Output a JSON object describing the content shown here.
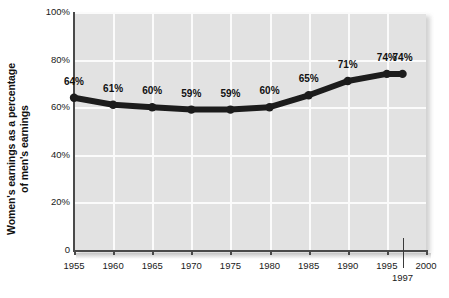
{
  "chart_data": {
    "type": "line",
    "title": "",
    "xlabel": "",
    "ylabel": "Women's earnings as a percentage of men's earnings",
    "ylabel_lines": [
      "Women's earnings as a percentage",
      "of men's earnings"
    ],
    "categories": [
      1955,
      1960,
      1965,
      1970,
      1975,
      1980,
      1985,
      1990,
      1995,
      1997
    ],
    "values": [
      64,
      61,
      60,
      59,
      59,
      60,
      65,
      71,
      74,
      74
    ],
    "point_labels": [
      "64%",
      "61%",
      "60%",
      "59%",
      "59%",
      "60%",
      "65%",
      "71%",
      "74%",
      "74%"
    ],
    "ylim": [
      0,
      100
    ],
    "xlim": [
      1955,
      2000
    ],
    "y_ticks": [
      0,
      20,
      40,
      60,
      80,
      100
    ],
    "y_tick_labels": [
      "0",
      "20%",
      "40%",
      "60%",
      "80%",
      "100%"
    ],
    "x_ticks": [
      1955,
      1960,
      1965,
      1970,
      1975,
      1980,
      1985,
      1990,
      1995,
      2000
    ],
    "x_tick_labels": [
      "1955",
      "1960",
      "1965",
      "1970",
      "1975",
      "1980",
      "1985",
      "1990",
      "1995",
      "2000"
    ],
    "x_extra_tick": 1997,
    "x_extra_tick_label": "1997",
    "grid": true,
    "legend": null,
    "series": [
      {
        "name": "Women's earnings as a percentage of men's earnings",
        "x": [
          1955,
          1960,
          1965,
          1970,
          1975,
          1980,
          1985,
          1990,
          1995,
          1997
        ],
        "values": [
          64,
          61,
          60,
          59,
          59,
          60,
          65,
          71,
          74,
          74
        ],
        "color": "#1c1c1c",
        "marker": "circle"
      }
    ]
  },
  "style": {
    "plot_background": "#e2e2e2",
    "gridline_color": "#fbfbfb",
    "axis_color": "#4a4a4a",
    "line_color": "#1c1c1c",
    "text_color": "#111111",
    "page_background": "#ffffff"
  }
}
